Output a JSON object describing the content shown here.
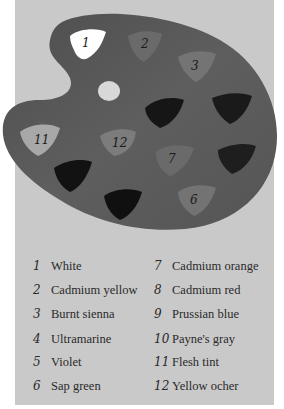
{
  "palette": {
    "board_color": "#5a5a5a",
    "thumb_hole_color": "#d8d8d8",
    "swatches": [
      {
        "number": "1",
        "label_shown": "1",
        "fill": "#ffffff"
      },
      {
        "number": "2",
        "label_shown": "2",
        "fill": "#6a6a6a"
      },
      {
        "number": "3",
        "label_shown": "3",
        "fill": "#747474"
      },
      {
        "number": "4",
        "label_shown": "",
        "fill": "#161616"
      },
      {
        "number": "5",
        "label_shown": "",
        "fill": "#1a1a1a"
      },
      {
        "number": "6",
        "label_shown": "6",
        "fill": "#737373"
      },
      {
        "number": "7",
        "label_shown": "7",
        "fill": "#6a6a6a"
      },
      {
        "number": "8",
        "label_shown": "",
        "fill": "#1e1e1e"
      },
      {
        "number": "9",
        "label_shown": "",
        "fill": "#121212"
      },
      {
        "number": "10",
        "label_shown": "",
        "fill": "#101010"
      },
      {
        "number": "11",
        "label_shown": "11",
        "fill": "#a8a8a8"
      },
      {
        "number": "12",
        "label_shown": "12",
        "fill": "#7c7c7c"
      }
    ]
  },
  "legend": {
    "left": [
      {
        "number": "1",
        "label": "White"
      },
      {
        "number": "2",
        "label": "Cadmium yellow"
      },
      {
        "number": "3",
        "label": "Burnt sienna"
      },
      {
        "number": "4",
        "label": "Ultramarine"
      },
      {
        "number": "5",
        "label": "Violet"
      },
      {
        "number": "6",
        "label": "Sap green"
      }
    ],
    "right": [
      {
        "number": "7",
        "label": "Cadmium orange"
      },
      {
        "number": "8",
        "label": "Cadmium red"
      },
      {
        "number": "9",
        "label": "Prussian blue"
      },
      {
        "number": "10",
        "label": "Payne's gray"
      },
      {
        "number": "11",
        "label": "Flesh tint"
      },
      {
        "number": "12",
        "label": "Yellow ocher"
      }
    ]
  }
}
